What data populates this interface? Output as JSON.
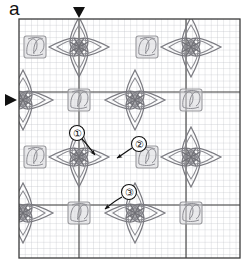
{
  "figure": {
    "panel_label": "a",
    "colors": {
      "fine_grid": "#b9bcc4",
      "major_grid": "#3c3c3c",
      "border": "#3c3c3c",
      "motif_star": "#7a7a80",
      "motif_square": "#9a9a9e",
      "marker": "#111111",
      "annotation": "#111111",
      "background": "#ffffff"
    },
    "plot_area": {
      "x": 19,
      "y": 19,
      "width": 221,
      "height": 239
    }
  },
  "grid": {
    "fine_cell_px": 6.2,
    "fine_columns": 36,
    "fine_rows": 39,
    "major_vertical_x": [
      79,
      186
    ],
    "major_horizontal_y": [
      92,
      205
    ],
    "border_on": true
  },
  "markers": [
    {
      "id": "top-marker",
      "glyph": "triangle-down",
      "x": 79,
      "y": 12,
      "axis": "vertical",
      "size": 11
    },
    {
      "id": "left-marker",
      "glyph": "triangle-right",
      "x": 11,
      "y": 100,
      "axis": "horizontal",
      "size": 11
    }
  ],
  "motifs": {
    "star": {
      "name": "four-petal-star-motif",
      "count": 8,
      "positions": [
        {
          "cx": 79,
          "cy": 47
        },
        {
          "cx": 191,
          "cy": 47
        },
        {
          "cx": 23,
          "cy": 100
        },
        {
          "cx": 135,
          "cy": 100
        },
        {
          "cx": 79,
          "cy": 157
        },
        {
          "cx": 191,
          "cy": 157
        },
        {
          "cx": 23,
          "cy": 213
        },
        {
          "cx": 135,
          "cy": 213
        }
      ]
    },
    "square": {
      "name": "faint-square-motif",
      "count": 8,
      "positions": [
        {
          "cx": 35,
          "cy": 47
        },
        {
          "cx": 147,
          "cy": 47
        },
        {
          "cx": 79,
          "cy": 100
        },
        {
          "cx": 191,
          "cy": 100
        },
        {
          "cx": 35,
          "cy": 157
        },
        {
          "cx": 147,
          "cy": 157
        },
        {
          "cx": 79,
          "cy": 213
        },
        {
          "cx": 191,
          "cy": 213
        }
      ]
    }
  },
  "annotations": [
    {
      "id": "annotation-1",
      "label": "①",
      "circle": {
        "cx": 77,
        "cy": 133,
        "r": 7.5
      },
      "arrow": {
        "x1": 82,
        "y1": 139,
        "x2": 95,
        "y2": 155
      },
      "target": "star-motif-core"
    },
    {
      "id": "annotation-2",
      "label": "②",
      "circle": {
        "cx": 139,
        "cy": 144,
        "r": 7.5
      },
      "arrow": {
        "x1": 132,
        "y1": 148,
        "x2": 117,
        "y2": 158
      },
      "target": "star-motif-petal"
    },
    {
      "id": "annotation-3",
      "label": "③",
      "circle": {
        "cx": 129,
        "cy": 192,
        "r": 7.5
      },
      "arrow": {
        "x1": 122,
        "y1": 197,
        "x2": 105,
        "y2": 209
      },
      "target": "faint-square-motif"
    }
  ]
}
